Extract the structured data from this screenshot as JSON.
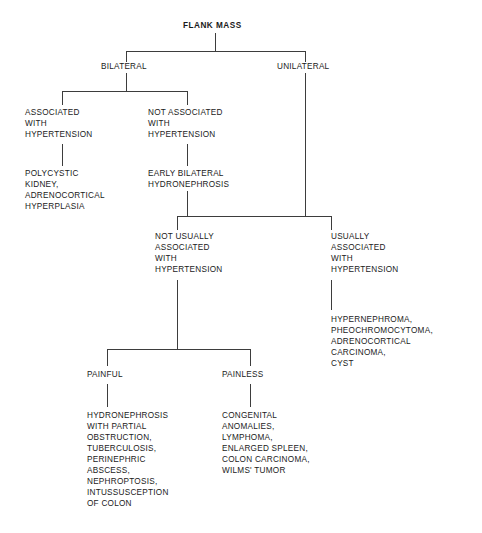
{
  "diagram": {
    "title": "FLANK MASS",
    "type": "decision-tree",
    "line_color": "#3d3d3d",
    "text_color": "#1a1a1a",
    "background_color": "#ffffff",
    "nodes": {
      "root": "FLANK MASS",
      "bilateral": "BILATERAL",
      "unilateral": "UNILATERAL",
      "bilateral_assoc_htn": "ASSOCIATED\nWITH\nHYPERTENSION",
      "bilateral_not_assoc_htn": "NOT ASSOCIATED\nWITH\nHYPERTENSION",
      "bilateral_assoc_htn_causes": "POLYCYSTIC\nKIDNEY,\nADRENOCORTICAL\nHYPERPLASIA",
      "bilateral_not_assoc_htn_causes": "EARLY BILATERAL\nHYDRONEPHROSIS",
      "uni_not_usually_htn": "NOT USUALLY\nASSOCIATED\nWITH\nHYPERTENSION",
      "uni_usually_htn": "USUALLY\nASSOCIATED\nWITH\nHYPERTENSION",
      "uni_usually_htn_causes": "HYPERNEPHROMA,\nPHEOCHROMOCYTOMA,\nADRENOCORTICAL\nCARCINOMA,\nCYST",
      "painful": "PAINFUL",
      "painless": "PAINLESS",
      "painful_causes": "HYDRONEPHROSIS\nWITH PARTIAL\nOBSTRUCTION,\nTUBERCULOSIS,\nPERINEPHRIC\nABSCESS,\nNEPHROPTOSIS,\nINTUSSUSCEPTION\nOF COLON",
      "painless_causes": "CONGENITAL\nANOMALIES,\nLYMPHOMA,\nENLARGED SPLEEN,\nCOLON CARCINOMA,\nWILMS' TUMOR"
    }
  }
}
